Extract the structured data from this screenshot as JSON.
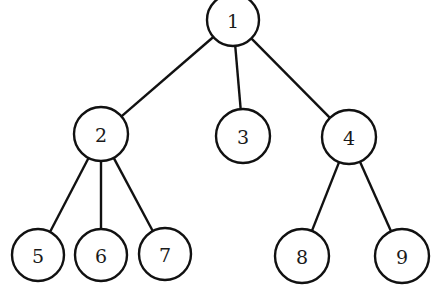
{
  "diagram": {
    "type": "tree",
    "colors": {
      "stroke": "#111111",
      "fill": "#ffffff",
      "text": "#1a1a1a"
    },
    "nodes": [
      {
        "id": "1",
        "label": "1",
        "x": 233,
        "y": 20,
        "r": 26
      },
      {
        "id": "2",
        "label": "2",
        "x": 101,
        "y": 134,
        "r": 27
      },
      {
        "id": "3",
        "label": "3",
        "x": 243,
        "y": 136,
        "r": 27
      },
      {
        "id": "4",
        "label": "4",
        "x": 349,
        "y": 137,
        "r": 27
      },
      {
        "id": "5",
        "label": "5",
        "x": 38,
        "y": 255,
        "r": 26
      },
      {
        "id": "6",
        "label": "6",
        "x": 101,
        "y": 255,
        "r": 26
      },
      {
        "id": "7",
        "label": "7",
        "x": 165,
        "y": 254,
        "r": 26
      },
      {
        "id": "8",
        "label": "8",
        "x": 302,
        "y": 256,
        "r": 27
      },
      {
        "id": "9",
        "label": "9",
        "x": 402,
        "y": 256,
        "r": 27
      }
    ],
    "edges": [
      {
        "from": "1",
        "to": "2"
      },
      {
        "from": "1",
        "to": "3"
      },
      {
        "from": "1",
        "to": "4"
      },
      {
        "from": "2",
        "to": "5"
      },
      {
        "from": "2",
        "to": "6"
      },
      {
        "from": "2",
        "to": "7"
      },
      {
        "from": "4",
        "to": "8"
      },
      {
        "from": "4",
        "to": "9"
      }
    ]
  }
}
